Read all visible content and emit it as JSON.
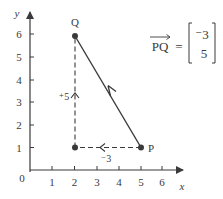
{
  "diagram": {
    "type": "coordinate-vector-diagram",
    "axes": {
      "x_label": "x",
      "y_label": "y",
      "origin_label": "0",
      "x_ticks": [
        "1",
        "2",
        "3",
        "4",
        "5",
        "6"
      ],
      "y_ticks": [
        "1",
        "2",
        "3",
        "4",
        "5",
        "6"
      ]
    },
    "points": {
      "P": {
        "label": "P",
        "x": 5,
        "y": 1
      },
      "Q": {
        "label": "Q",
        "x": 2,
        "y": 6
      },
      "corner": {
        "x": 2,
        "y": 1
      }
    },
    "components": {
      "horizontal": {
        "label": "⁻3",
        "value": -3
      },
      "vertical": {
        "label": "⁺5",
        "value": 5
      }
    },
    "vector_equation": {
      "lhs": "PQ",
      "equals": "=",
      "top": "⁻3",
      "bottom": "5"
    },
    "colors": {
      "ink": "#3a3a3a",
      "background": "#ffffff"
    }
  }
}
